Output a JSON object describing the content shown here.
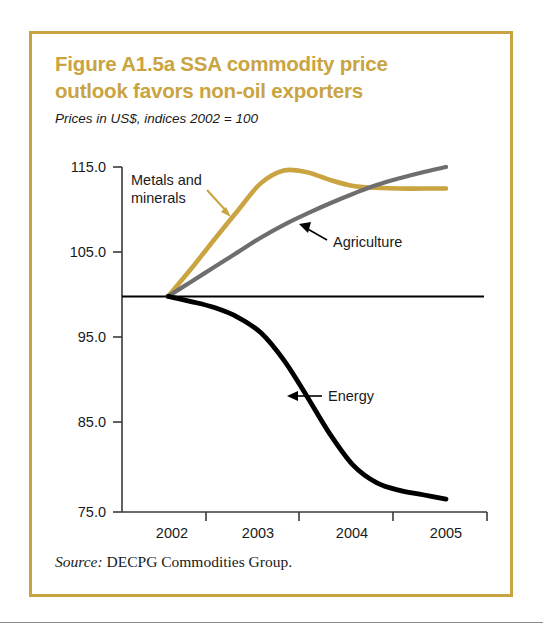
{
  "figure": {
    "title_line1": "Figure A1.5a  SSA commodity price",
    "title_line2": "outlook favors non-oil exporters",
    "subtitle": "Prices in US$, indices 2002 = 100",
    "source_word": "Source:",
    "source_text": " DECPG Commodities Group.",
    "border_color": "#c9a441",
    "title_color": "#c9a441"
  },
  "chart_data": {
    "type": "line",
    "title": "Figure A1.5a  SSA commodity price outlook favors non-oil exporters",
    "subtitle": "Prices in US$, indices 2002 = 100",
    "xlabel": "",
    "ylabel": "",
    "xlim": [
      2001.75,
      2005.25
    ],
    "ylim": [
      75.0,
      115.0
    ],
    "grid": false,
    "legend": "annotations",
    "y_ticks": [
      "115.0",
      "105.0",
      "95.0",
      "85.0",
      "75.0"
    ],
    "y_tick_values": [
      115.0,
      105.0,
      95.0,
      85.0,
      75.0
    ],
    "x_ticks": [
      "2002",
      "2003",
      "2004",
      "2005"
    ],
    "x_tick_values": [
      2002,
      2003,
      2004,
      2005
    ],
    "reference_line": {
      "value": 100,
      "label": "2002 = 100",
      "color": "#000000"
    },
    "series": [
      {
        "name": "Metals and minerals",
        "color": "#c9a441",
        "x": [
          2002.0,
          2002.25,
          2002.5,
          2002.75,
          2003.0,
          2003.25,
          2003.5,
          2003.75,
          2004.0,
          2004.25,
          2004.5,
          2004.75,
          2005.0
        ],
        "values": [
          100.0,
          103.2,
          106.6,
          109.9,
          113.1,
          114.6,
          114.4,
          113.5,
          112.8,
          112.6,
          112.5,
          112.5,
          112.5
        ]
      },
      {
        "name": "Agriculture",
        "color": "#6e6e6e",
        "x": [
          2002.0,
          2002.25,
          2002.5,
          2002.75,
          2003.0,
          2003.25,
          2003.5,
          2003.75,
          2004.0,
          2004.25,
          2004.5,
          2004.75,
          2005.0
        ],
        "values": [
          100.0,
          101.7,
          103.4,
          105.1,
          106.8,
          108.3,
          109.6,
          110.8,
          111.9,
          112.9,
          113.7,
          114.4,
          115.0
        ]
      },
      {
        "name": "Energy",
        "color": "#000000",
        "x": [
          2002.0,
          2002.25,
          2002.5,
          2002.75,
          2003.0,
          2003.25,
          2003.5,
          2003.75,
          2004.0,
          2004.25,
          2004.5,
          2004.75,
          2005.0
        ],
        "values": [
          100.0,
          99.4,
          98.7,
          97.6,
          95.8,
          92.6,
          88.4,
          84.0,
          80.4,
          78.4,
          77.5,
          77.0,
          76.5
        ]
      }
    ],
    "annotations": [
      {
        "name": "Metals and minerals",
        "text_line1": "Metals and",
        "text_line2": "minerals",
        "arrow_color": "#c9a441"
      },
      {
        "name": "Agriculture",
        "text_line1": "Agriculture",
        "arrow_color": "#000000"
      },
      {
        "name": "Energy",
        "text_line1": "Energy",
        "arrow_color": "#000000"
      }
    ]
  }
}
